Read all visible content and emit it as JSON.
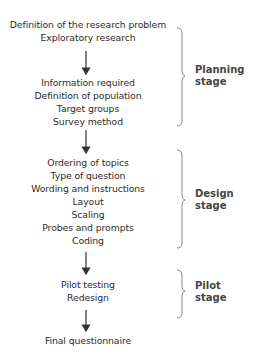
{
  "diagram": {
    "planning_items": [
      "Definition of the research problem",
      "Exploratory research",
      "Information required",
      "Definition of population",
      "Target groups",
      "Survey method"
    ],
    "design_items": [
      "Ordering of topics",
      "Type of question",
      "Wording and instructions",
      "Layout",
      "Scaling",
      "Probes and prompts",
      "Coding"
    ],
    "pilot_items": [
      "Pilot testing",
      "Redesign"
    ],
    "final_item": "Final questionnaire",
    "stages": {
      "planning": {
        "line1": "Planning",
        "line2": "stage"
      },
      "design": {
        "line1": "Design",
        "line2": "stage"
      },
      "pilot": {
        "line1": "Pilot",
        "line2": "stage"
      }
    }
  }
}
